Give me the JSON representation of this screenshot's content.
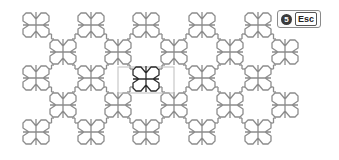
{
  "canvas": {
    "background": "#ffffff",
    "pattern_color": "#8c8c8c",
    "highlight_color": "#2b2b2b",
    "selection_color": "#bdbdbd",
    "motif_half_size": 13,
    "grid_rows_y": [
      25,
      78,
      132
    ],
    "grid_cols_x": [
      36,
      91,
      146,
      202,
      258
    ],
    "offset_rows_y": [
      52,
      105
    ],
    "offset_cols_x": [
      63,
      118,
      174,
      230,
      285
    ],
    "highlighted_motif": {
      "x": 146,
      "y": 79
    },
    "selection_rect": {
      "x": 118,
      "y": 67,
      "w": 56,
      "h": 26
    }
  },
  "badge": {
    "step_number": "5",
    "key_label": "Esc"
  }
}
